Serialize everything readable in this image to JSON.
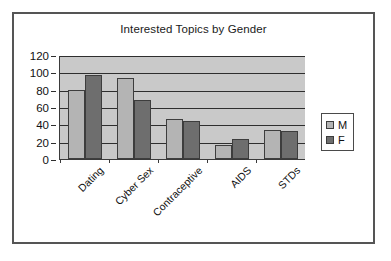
{
  "chart_data": {
    "type": "bar",
    "title": "Interested Topics by Gender",
    "xlabel": "",
    "ylabel": "",
    "ylim": [
      0,
      120
    ],
    "yticks": [
      0,
      20,
      40,
      60,
      80,
      100,
      120
    ],
    "grid": true,
    "legend_position": "right",
    "categories": [
      "Dating",
      "Cyber Sex",
      "Contraceptive",
      "AIDS",
      "STDs"
    ],
    "series": [
      {
        "name": "M",
        "color": "#b4b4b4",
        "values": [
          80,
          94,
          46,
          16,
          33
        ]
      },
      {
        "name": "F",
        "color": "#6e6e6e",
        "values": [
          97,
          68,
          44,
          23,
          32
        ]
      }
    ]
  },
  "legend": {
    "entries": [
      {
        "label": "M"
      },
      {
        "label": "F"
      }
    ]
  },
  "colors": {
    "plot_background": "#c9c9c9",
    "frame_border": "#555555",
    "gridline": "#2e2e2e",
    "series_m": "#b4b4b4",
    "series_f": "#6e6e6e"
  }
}
